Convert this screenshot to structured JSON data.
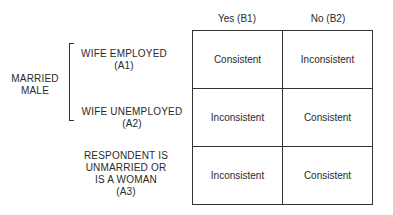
{
  "columns": [
    {
      "label": "Yes (B1)"
    },
    {
      "label": "No (B2)"
    }
  ],
  "group": {
    "label_line1": "MARRIED",
    "label_line2": "MALE"
  },
  "rows": [
    {
      "line1": "WIFE EMPLOYED",
      "line2": "(A1)",
      "cells": [
        "Consistent",
        "Inconsistent"
      ]
    },
    {
      "line1": "WIFE UNEMPLOYED",
      "line2": "(A2)",
      "cells": [
        "Inconsistent",
        "Consistent"
      ]
    },
    {
      "line1": "RESPONDENT IS",
      "line2": "UNMARRIED OR",
      "line3": "IS A WOMAN",
      "line4": "(A3)",
      "cells": [
        "Inconsistent",
        "Consistent"
      ]
    }
  ]
}
